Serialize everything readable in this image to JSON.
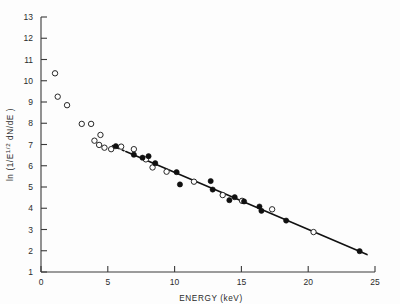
{
  "figure": {
    "name": "energy-spectrum-scatter",
    "background": "#fdfdfd",
    "frame_color": "#3a3a3a",
    "marker_open_color": "#ffffff",
    "marker_filled_color": "#101010",
    "fit_line_color": "#111111"
  },
  "chart_data": {
    "type": "scatter",
    "title": "",
    "subtitle": "",
    "xlabel": "ENERGY (keV)",
    "ylabel": "ln (1/E^1/2 dN/dE)",
    "ylabel_parts": {
      "prefix": "ln (1/E",
      "exponent": "1/2",
      "suffix": " dN/dE )"
    },
    "xlim": [
      0,
      25
    ],
    "ylim": [
      1,
      13
    ],
    "xticks": [
      0,
      5,
      10,
      15,
      20,
      25
    ],
    "xticklabels": [
      "0",
      "5",
      "10",
      "15",
      "20",
      "25"
    ],
    "yticks": [
      1,
      2,
      3,
      4,
      5,
      6,
      7,
      8,
      9,
      10,
      11,
      12,
      13
    ],
    "yticklabels": [
      "1",
      "2",
      "3",
      "4",
      "5",
      "6",
      "7",
      "8",
      "9",
      "10",
      "11",
      "12",
      "13"
    ],
    "grid": false,
    "legend": false,
    "legend_position": "none",
    "axis_style": "open-left-bottom",
    "series": [
      {
        "name": "open circles",
        "marker": "open-circle",
        "points": [
          [
            1.05,
            10.35
          ],
          [
            1.25,
            9.25
          ],
          [
            1.95,
            8.85
          ],
          [
            3.05,
            7.97
          ],
          [
            3.75,
            7.97
          ],
          [
            4.45,
            7.45
          ],
          [
            4.0,
            7.18
          ],
          [
            4.35,
            6.98
          ],
          [
            4.75,
            6.85
          ],
          [
            5.25,
            6.78
          ],
          [
            6.0,
            6.9
          ],
          [
            6.95,
            6.78
          ],
          [
            7.85,
            6.3
          ],
          [
            8.35,
            5.92
          ],
          [
            9.4,
            5.72
          ],
          [
            11.45,
            5.25
          ],
          [
            13.6,
            4.62
          ],
          [
            15.05,
            4.35
          ],
          [
            17.3,
            3.95
          ],
          [
            20.4,
            2.88
          ]
        ]
      },
      {
        "name": "filled circles",
        "marker": "filled-circle",
        "points": [
          [
            5.6,
            6.92
          ],
          [
            6.95,
            6.52
          ],
          [
            7.6,
            6.38
          ],
          [
            8.05,
            6.45
          ],
          [
            8.55,
            6.12
          ],
          [
            10.15,
            5.7
          ],
          [
            10.4,
            5.12
          ],
          [
            12.7,
            5.28
          ],
          [
            12.85,
            4.88
          ],
          [
            14.5,
            4.52
          ],
          [
            14.1,
            4.38
          ],
          [
            15.2,
            4.32
          ],
          [
            16.35,
            4.08
          ],
          [
            16.5,
            3.88
          ],
          [
            18.35,
            3.42
          ],
          [
            23.85,
            1.98
          ]
        ]
      }
    ],
    "fit_line": {
      "name": "least-squares fit",
      "style": "solid-with-dashed-start",
      "x_start": 5.3,
      "x_end": 24.4,
      "y_start": 6.95,
      "y_end": 1.82,
      "dashed_x_start": 5.3,
      "dashed_x_end": 6.35
    }
  }
}
